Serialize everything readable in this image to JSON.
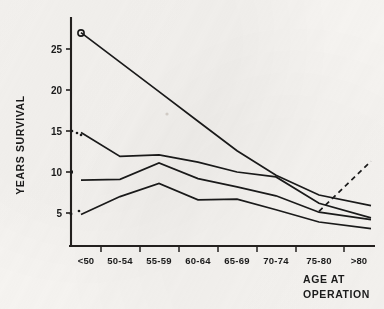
{
  "chart_data": {
    "type": "line",
    "title": "",
    "subtitle": "",
    "xlabel": "AGE AT OPERATION",
    "ylabel": "YEARS SURVIVAL",
    "categories": [
      "<50",
      "50-54",
      "55-59",
      "60-64",
      "65-69",
      "70-74",
      "75-80",
      ">80"
    ],
    "ytick_labels": [
      "5",
      "10",
      "15",
      "20",
      "25"
    ],
    "ytick_values": [
      5,
      10,
      15,
      20,
      25
    ],
    "ylim": [
      0,
      29
    ],
    "grid": false,
    "legend_position": "none",
    "annotations": [
      {
        "name": "x-axis-caption",
        "text": "AGE AT OPERATION"
      }
    ],
    "series": [
      {
        "name": "curve-1",
        "style": "solid",
        "marker": "open-circle",
        "marker_at": "<50",
        "values": [
          27.0,
          23.4,
          19.8,
          16.2,
          12.6,
          9.6,
          7.2,
          5.9
        ]
      },
      {
        "name": "curve-2",
        "style": "solid",
        "marker": "dots",
        "marker_at": "<50",
        "values": [
          14.8,
          11.9,
          12.1,
          11.2,
          10.0,
          9.4,
          6.2,
          4.4
        ]
      },
      {
        "name": "curve-3",
        "style": "solid",
        "marker": "dot",
        "marker_at": "<50",
        "values": [
          9.0,
          9.1,
          11.1,
          9.2,
          8.2,
          7.1,
          5.1,
          4.2
        ]
      },
      {
        "name": "curve-4",
        "style": "solid",
        "marker": "dots",
        "marker_at": "<50",
        "values": [
          4.8,
          7.0,
          8.6,
          6.6,
          6.7,
          5.4,
          3.9,
          3.1
        ]
      },
      {
        "name": "curve-5-dashed",
        "style": "dashed",
        "marker": "none",
        "marker_at": "",
        "values": [
          null,
          null,
          null,
          null,
          null,
          null,
          5.2,
          11.3
        ]
      }
    ]
  }
}
